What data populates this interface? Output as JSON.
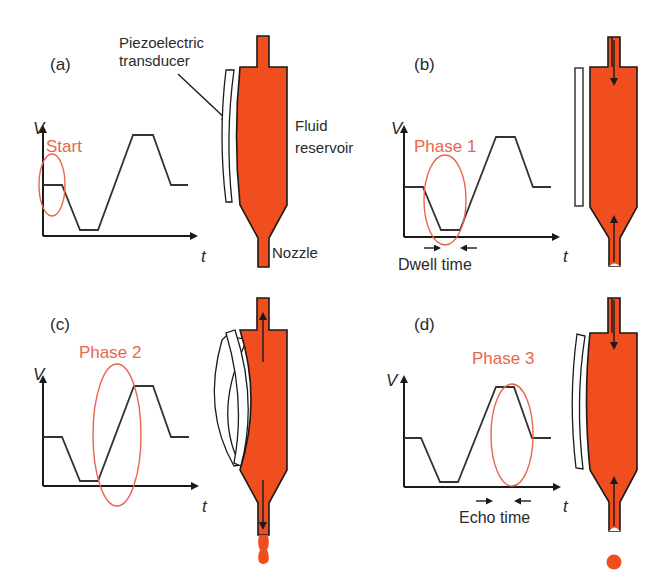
{
  "figure": {
    "colors": {
      "fluid": "#f04e1e",
      "highlight": "#e8664d",
      "line": "#1a1a1a"
    },
    "annotations": {
      "piezo_line1": "Piezoelectric",
      "piezo_line2": "transducer",
      "fluid_line1": "Fluid",
      "fluid_line2": "reservoir",
      "nozzle": "Nozzle"
    },
    "panels": [
      {
        "id": "a",
        "label": "(a)",
        "phase_label": "Start",
        "y_axis": "V",
        "x_axis": "t",
        "timing_label": "",
        "transducer_state": "relaxed-curved",
        "flow_arrows": "none",
        "droplet": "none"
      },
      {
        "id": "b",
        "label": "(b)",
        "phase_label": "Phase 1",
        "y_axis": "V",
        "x_axis": "t",
        "timing_label": "Dwell time",
        "transducer_state": "straight",
        "flow_arrows": "inward",
        "droplet": "none"
      },
      {
        "id": "c",
        "label": "(c)",
        "phase_label": "Phase 2",
        "y_axis": "V",
        "x_axis": "t",
        "timing_label": "",
        "transducer_state": "strongly-curved",
        "flow_arrows": "outward",
        "droplet": "ejecting"
      },
      {
        "id": "d",
        "label": "(d)",
        "phase_label": "Phase 3",
        "y_axis": "V",
        "x_axis": "t",
        "timing_label": "Echo time",
        "transducer_state": "relaxed-curved",
        "flow_arrows": "inward",
        "droplet": "detached"
      }
    ],
    "waveform": {
      "description": "Trapezoidal voltage: initial level, fall to minimum (dwell), rise to maximum, hold (echo), return to initial level",
      "levels": [
        "initial",
        "minimum",
        "maximum",
        "initial"
      ]
    }
  }
}
